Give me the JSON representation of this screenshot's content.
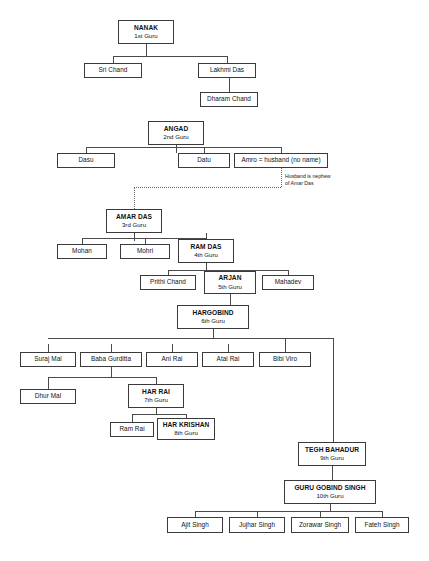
{
  "diagram": {
    "background": "#ffffff",
    "box_border_color": "#3a3a3a",
    "line_color": "#4a4a4a"
  },
  "nodes": [
    {
      "id": "nanak",
      "name": "NANAK",
      "rank": "1st Guru",
      "guru": true,
      "x": 118,
      "y": 20,
      "w": 56,
      "h": 24
    },
    {
      "id": "sri_chand",
      "name": "Sri Chand",
      "rank": "",
      "guru": false,
      "x": 84,
      "y": 63,
      "w": 58,
      "h": 15
    },
    {
      "id": "lakhmi_das",
      "name": "Lakhmi Das",
      "rank": "",
      "guru": false,
      "x": 198,
      "y": 63,
      "w": 58,
      "h": 15
    },
    {
      "id": "dharam_chand",
      "name": "Dharam Chand",
      "rank": "",
      "guru": false,
      "x": 200,
      "y": 92,
      "w": 58,
      "h": 15
    },
    {
      "id": "angad",
      "name": "ANGAD",
      "rank": "2nd Guru",
      "guru": true,
      "x": 148,
      "y": 121,
      "w": 56,
      "h": 24
    },
    {
      "id": "dasu",
      "name": "Dasu",
      "rank": "",
      "guru": false,
      "x": 57,
      "y": 153,
      "w": 58,
      "h": 15
    },
    {
      "id": "datu",
      "name": "Datu",
      "rank": "",
      "guru": false,
      "x": 178,
      "y": 153,
      "w": 52,
      "h": 15
    },
    {
      "id": "amro",
      "name": "Amro = husband (no name)",
      "rank": "",
      "guru": false,
      "x": 234,
      "y": 153,
      "w": 94,
      "h": 15
    },
    {
      "id": "amar_das",
      "name": "AMAR DAS",
      "rank": "3rd Guru",
      "guru": true,
      "x": 106,
      "y": 209,
      "w": 56,
      "h": 24
    },
    {
      "id": "mohan",
      "name": "Mohan",
      "rank": "",
      "guru": false,
      "x": 57,
      "y": 244,
      "w": 50,
      "h": 15
    },
    {
      "id": "mohri",
      "name": "Mohri",
      "rank": "",
      "guru": false,
      "x": 120,
      "y": 244,
      "w": 50,
      "h": 15
    },
    {
      "id": "ram_das",
      "name": "RAM DAS",
      "rank": "4th Guru",
      "guru": true,
      "x": 178,
      "y": 239,
      "w": 56,
      "h": 24
    },
    {
      "id": "prithi_chand",
      "name": "Prithi Chand",
      "rank": "",
      "guru": false,
      "x": 140,
      "y": 275,
      "w": 56,
      "h": 15
    },
    {
      "id": "arjan",
      "name": "ARJAN",
      "rank": "5th Guru",
      "guru": true,
      "x": 204,
      "y": 271,
      "w": 52,
      "h": 23
    },
    {
      "id": "mahadev",
      "name": "Mahadev",
      "rank": "",
      "guru": false,
      "x": 262,
      "y": 275,
      "w": 52,
      "h": 15
    },
    {
      "id": "hargobind",
      "name": "HARGOBIND",
      "rank": "6th Guru",
      "guru": true,
      "x": 177,
      "y": 305,
      "w": 72,
      "h": 24
    },
    {
      "id": "suraj_mal",
      "name": "Suraj Mal",
      "rank": "",
      "guru": false,
      "x": 20,
      "y": 352,
      "w": 56,
      "h": 15
    },
    {
      "id": "baba_gurditta",
      "name": "Baba Gurditta",
      "rank": "",
      "guru": false,
      "x": 80,
      "y": 352,
      "w": 62,
      "h": 15
    },
    {
      "id": "ani_rai",
      "name": "Ani Rai",
      "rank": "",
      "guru": false,
      "x": 146,
      "y": 352,
      "w": 52,
      "h": 15
    },
    {
      "id": "atal_rai",
      "name": "Atal Rai",
      "rank": "",
      "guru": false,
      "x": 202,
      "y": 352,
      "w": 52,
      "h": 15
    },
    {
      "id": "bibi_viro",
      "name": "Bibi Viro",
      "rank": "",
      "guru": false,
      "x": 259,
      "y": 352,
      "w": 52,
      "h": 15
    },
    {
      "id": "dhur_mal",
      "name": "Dhur Mal",
      "rank": "",
      "guru": false,
      "x": 20,
      "y": 389,
      "w": 56,
      "h": 15
    },
    {
      "id": "har_rai",
      "name": "HAR RAI",
      "rank": "7th Guru",
      "guru": true,
      "x": 128,
      "y": 384,
      "w": 56,
      "h": 24
    },
    {
      "id": "ram_rai",
      "name": "Ram Rai",
      "rank": "",
      "guru": false,
      "x": 110,
      "y": 422,
      "w": 44,
      "h": 15
    },
    {
      "id": "har_krishan",
      "name": "HAR KRISHAN",
      "rank": "8th Guru",
      "guru": true,
      "x": 157,
      "y": 418,
      "w": 58,
      "h": 22
    },
    {
      "id": "tegh_bahadur",
      "name": "TEGH BAHADUR",
      "rank": "9th Guru",
      "guru": true,
      "x": 298,
      "y": 442,
      "w": 68,
      "h": 24
    },
    {
      "id": "gobind_singh",
      "name": "GURU GOBIND SINGH",
      "rank": "10th Guru",
      "guru": true,
      "x": 284,
      "y": 480,
      "w": 92,
      "h": 24
    },
    {
      "id": "ajit_singh",
      "name": "Ajit Singh",
      "rank": "",
      "guru": false,
      "x": 167,
      "y": 517,
      "w": 56,
      "h": 16
    },
    {
      "id": "jujhar_singh",
      "name": "Jujhar Singh",
      "rank": "",
      "guru": false,
      "x": 229,
      "y": 517,
      "w": 56,
      "h": 16
    },
    {
      "id": "zorawar_singh",
      "name": "Zorawar Singh",
      "rank": "",
      "guru": false,
      "x": 291,
      "y": 517,
      "w": 58,
      "h": 16
    },
    {
      "id": "fateh_singh",
      "name": "Fateh Singh",
      "rank": "",
      "guru": false,
      "x": 355,
      "y": 517,
      "w": 54,
      "h": 16
    }
  ],
  "annotations": [
    {
      "id": "husband_note",
      "text": "Husband is nephew\nof Amar Das",
      "x": 285,
      "y": 173
    }
  ],
  "connectors": [
    {
      "t": "v",
      "x": 146,
      "y": 44,
      "len": 13
    },
    {
      "t": "h",
      "x": 113,
      "y": 56,
      "len": 114
    },
    {
      "t": "v",
      "x": 113,
      "y": 56,
      "len": 7
    },
    {
      "t": "v",
      "x": 227,
      "y": 56,
      "len": 7
    },
    {
      "t": "v",
      "x": 229,
      "y": 78,
      "len": 14
    },
    {
      "t": "v",
      "x": 176,
      "y": 145,
      "len": 8
    },
    {
      "t": "h",
      "x": 86,
      "y": 147,
      "len": 195
    },
    {
      "t": "v",
      "x": 86,
      "y": 147,
      "len": 6
    },
    {
      "t": "v",
      "x": 204,
      "y": 147,
      "len": 6
    },
    {
      "t": "v",
      "x": 281,
      "y": 147,
      "len": 6
    },
    {
      "t": "v",
      "x": 134,
      "y": 233,
      "len": 8
    },
    {
      "t": "h",
      "x": 82,
      "y": 238,
      "len": 124
    },
    {
      "t": "v",
      "x": 82,
      "y": 238,
      "len": 6
    },
    {
      "t": "v",
      "x": 145,
      "y": 238,
      "len": 6
    },
    {
      "t": "v",
      "x": 206,
      "y": 233,
      "len": 6
    },
    {
      "t": "v",
      "x": 206,
      "y": 263,
      "len": 7
    },
    {
      "t": "h",
      "x": 168,
      "y": 270,
      "len": 120
    },
    {
      "t": "v",
      "x": 168,
      "y": 270,
      "len": 5
    },
    {
      "t": "v",
      "x": 288,
      "y": 270,
      "len": 5
    },
    {
      "t": "v",
      "x": 230,
      "y": 294,
      "len": 11
    },
    {
      "t": "v",
      "x": 213,
      "y": 329,
      "len": 9
    },
    {
      "t": "h",
      "x": 48,
      "y": 338,
      "len": 285
    },
    {
      "t": "v",
      "x": 48,
      "y": 344,
      "len": 8
    },
    {
      "t": "v",
      "x": 111,
      "y": 344,
      "len": 8
    },
    {
      "t": "v",
      "x": 172,
      "y": 344,
      "len": 8
    },
    {
      "t": "v",
      "x": 228,
      "y": 344,
      "len": 8
    },
    {
      "t": "v",
      "x": 285,
      "y": 338,
      "len": 14
    },
    {
      "t": "v",
      "x": 333,
      "y": 338,
      "len": 104
    },
    {
      "t": "h",
      "x": 333,
      "y": 442,
      "len": 0
    },
    {
      "t": "v",
      "x": 111,
      "y": 367,
      "len": 10
    },
    {
      "t": "h",
      "x": 48,
      "y": 377,
      "len": 108
    },
    {
      "t": "v",
      "x": 48,
      "y": 377,
      "len": 12
    },
    {
      "t": "v",
      "x": 156,
      "y": 377,
      "len": 7
    },
    {
      "t": "v",
      "x": 156,
      "y": 408,
      "len": 6
    },
    {
      "t": "h",
      "x": 132,
      "y": 414,
      "len": 54
    },
    {
      "t": "v",
      "x": 132,
      "y": 414,
      "len": 8
    },
    {
      "t": "v",
      "x": 186,
      "y": 414,
      "len": 4
    },
    {
      "t": "v",
      "x": 332,
      "y": 466,
      "len": 14
    },
    {
      "t": "v",
      "x": 330,
      "y": 504,
      "len": 7
    },
    {
      "t": "h",
      "x": 195,
      "y": 511,
      "len": 187
    },
    {
      "t": "v",
      "x": 195,
      "y": 511,
      "len": 6
    },
    {
      "t": "v",
      "x": 257,
      "y": 511,
      "len": 6
    },
    {
      "t": "v",
      "x": 320,
      "y": 511,
      "len": 6
    },
    {
      "t": "v",
      "x": 382,
      "y": 511,
      "len": 6
    }
  ],
  "dotted_connectors": [
    {
      "t": "v",
      "x": 281,
      "y": 168,
      "len": 19
    },
    {
      "t": "h",
      "x": 134,
      "y": 187,
      "len": 147
    },
    {
      "t": "v",
      "x": 134,
      "y": 187,
      "len": 22
    }
  ]
}
